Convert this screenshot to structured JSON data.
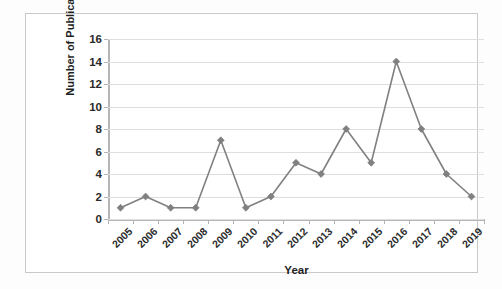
{
  "chart_data": {
    "type": "line",
    "title": "",
    "xlabel": "Year",
    "ylabel": "Number of Publications",
    "categories": [
      "2005",
      "2006",
      "2007",
      "2008",
      "2009",
      "2010",
      "2011",
      "2012",
      "2013",
      "2014",
      "2015",
      "2016",
      "2017",
      "2018",
      "2019"
    ],
    "values": [
      1,
      2,
      1,
      1,
      7,
      1,
      2,
      5,
      4,
      8,
      5,
      14,
      8,
      4,
      2
    ],
    "series": [
      {
        "name": "Number of Publications",
        "values": [
          1,
          2,
          1,
          1,
          7,
          1,
          2,
          5,
          4,
          8,
          5,
          14,
          8,
          4,
          2
        ]
      }
    ],
    "ylim": [
      0,
      16
    ],
    "yticks": [
      0,
      2,
      4,
      6,
      8,
      10,
      12,
      14,
      16
    ],
    "ytick_labels": [
      "0",
      "2",
      "4",
      "6",
      "8",
      "10",
      "12",
      "14",
      "16"
    ],
    "grid": "horizontal",
    "legend": "none",
    "marker": "diamond",
    "line_color": "#808080",
    "marker_color": "#808080",
    "grid_color": "#dedede",
    "axis_color": "#b5b5b5",
    "text_color": "#1f1f1f",
    "background": "#ffffff",
    "xtick_rotation": -45
  }
}
